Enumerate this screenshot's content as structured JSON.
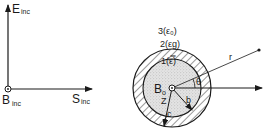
{
  "incident_axes": {
    "e_label": "E",
    "e_sub": "inc",
    "b_label": "B",
    "b_sub": "inc",
    "s_label": "S",
    "s_sub": "inc"
  },
  "cylinder": {
    "region3": "3(ε₀)",
    "region2": "2(εg)",
    "region1": "1(ε̿)",
    "center_label": "B",
    "center_sub": "o",
    "axis_label": "Z",
    "radius_inner": "b",
    "radius_outer": "c",
    "ray_label": "r",
    "angle_label": "θ"
  },
  "colors": {
    "ink": "#1a1a1a",
    "core_fill": "#d6d6d6",
    "background": "#ffffff"
  }
}
